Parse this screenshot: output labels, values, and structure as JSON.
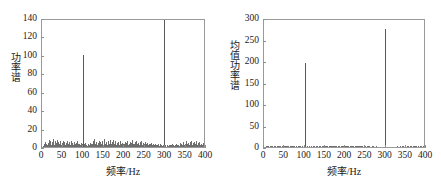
{
  "figure": {
    "panels": [
      "left",
      "right"
    ]
  },
  "chart_data": [
    {
      "panel": "left",
      "type": "line",
      "title": "",
      "xlabel": "频率/Hz",
      "ylabel": "功率谱",
      "xlim": [
        0,
        400
      ],
      "ylim": [
        0,
        140
      ],
      "xticks": [
        0,
        50,
        100,
        150,
        200,
        250,
        300,
        350,
        400
      ],
      "xtick_labels": [
        "0",
        "50",
        "100",
        "150",
        "200",
        "250",
        "300",
        "350",
        "400"
      ],
      "yticks": [
        0,
        20,
        40,
        60,
        80,
        100,
        120,
        140
      ],
      "ytick_labels": [
        "0",
        "20",
        "40",
        "60",
        "80",
        "100",
        "120",
        "140"
      ],
      "grid": false,
      "legend": null,
      "peaks": [
        {
          "x": 100,
          "y": 100
        },
        {
          "x": 301,
          "y": 140
        }
      ],
      "x": [
        2,
        4,
        6,
        8,
        10,
        12,
        14,
        16,
        18,
        20,
        22,
        24,
        26,
        28,
        30,
        32,
        34,
        36,
        38,
        40,
        42,
        44,
        46,
        48,
        50,
        52,
        54,
        56,
        58,
        60,
        62,
        64,
        66,
        68,
        70,
        72,
        74,
        76,
        78,
        80,
        82,
        84,
        86,
        88,
        90,
        92,
        94,
        96,
        98,
        100,
        102,
        104,
        106,
        108,
        110,
        112,
        114,
        116,
        118,
        120,
        122,
        124,
        126,
        128,
        130,
        132,
        134,
        136,
        138,
        140,
        142,
        144,
        146,
        148,
        150,
        152,
        154,
        156,
        158,
        160,
        162,
        164,
        166,
        168,
        170,
        172,
        174,
        176,
        178,
        180,
        182,
        184,
        186,
        188,
        190,
        192,
        194,
        196,
        198,
        200,
        202,
        204,
        206,
        208,
        210,
        212,
        214,
        216,
        218,
        220,
        222,
        224,
        226,
        228,
        230,
        232,
        234,
        236,
        238,
        240,
        242,
        244,
        246,
        248,
        250,
        252,
        254,
        256,
        258,
        260,
        262,
        264,
        266,
        268,
        270,
        272,
        274,
        276,
        278,
        280,
        282,
        284,
        286,
        288,
        290,
        292,
        294,
        296,
        298,
        301,
        304,
        306,
        308,
        310,
        312,
        314,
        316,
        318,
        320,
        322,
        324,
        326,
        328,
        330,
        332,
        334,
        336,
        338,
        340,
        342,
        344,
        346,
        348,
        350,
        352,
        354,
        356,
        358,
        360,
        362,
        364,
        366,
        368,
        370,
        372,
        374,
        376,
        378,
        380,
        382,
        384,
        386,
        388,
        390,
        392,
        394,
        396,
        398
      ],
      "values": [
        1.5,
        3.0,
        2.2,
        5.5,
        3.2,
        1.8,
        4.8,
        7.2,
        3.4,
        6.8,
        2.6,
        5.0,
        8.4,
        3.6,
        2.0,
        6.2,
        4.4,
        7.6,
        2.8,
        5.4,
        3.0,
        6.0,
        2.4,
        4.2,
        7.0,
        3.2,
        5.8,
        2.2,
        4.6,
        6.4,
        2.8,
        3.8,
        5.2,
        2.0,
        6.6,
        3.4,
        4.0,
        2.6,
        5.6,
        3.0,
        2.2,
        4.4,
        6.0,
        2.8,
        3.6,
        1.8,
        4.8,
        2.4,
        3.2,
        100.0,
        3.0,
        2.0,
        4.2,
        2.6,
        1.6,
        3.4,
        2.2,
        4.0,
        1.8,
        2.8,
        3.6,
        6.4,
        2.4,
        8.2,
        3.0,
        5.6,
        2.0,
        4.4,
        7.0,
        2.6,
        5.2,
        3.4,
        6.8,
        2.2,
        4.0,
        8.6,
        3.2,
        5.8,
        2.4,
        6.2,
        4.6,
        2.8,
        7.4,
        3.0,
        5.0,
        2.2,
        8.0,
        3.8,
        6.6,
        2.6,
        4.2,
        3.0,
        5.4,
        2.0,
        6.0,
        3.6,
        2.4,
        4.8,
        2.8,
        3.2,
        5.6,
        2.2,
        4.0,
        6.2,
        2.6,
        3.4,
        5.0,
        2.0,
        4.6,
        7.2,
        2.8,
        3.8,
        5.8,
        2.4,
        6.4,
        3.0,
        4.2,
        2.2,
        5.2,
        3.6,
        6.8,
        2.6,
        4.4,
        3.2,
        5.6,
        2.0,
        3.0,
        4.8,
        2.4,
        3.4,
        1.8,
        2.8,
        4.0,
        2.2,
        3.2,
        1.6,
        2.6,
        3.8,
        2.0,
        1.8,
        3.0,
        2.4,
        1.4,
        2.8,
        2.0,
        1.6,
        2.2,
        1.8,
        140.0,
        2.2,
        1.6,
        2.0,
        1.4,
        2.6,
        1.8,
        2.2,
        1.6,
        2.8,
        2.0,
        1.4,
        2.4,
        1.8,
        3.2,
        2.0,
        2.6,
        1.6,
        4.2,
        2.2,
        3.0,
        1.8,
        5.4,
        2.6,
        3.8,
        2.0,
        6.0,
        3.2,
        4.6,
        2.4,
        5.0,
        3.0,
        6.6,
        2.2,
        4.0,
        5.8,
        2.8,
        3.6,
        6.2,
        2.4,
        4.4,
        3.0,
        5.2,
        2.0,
        3.8,
        2.6,
        4.8,
        2.2,
        3.4,
        5.0,
        2.8,
        3.0,
        2.0
      ]
    },
    {
      "panel": "right",
      "type": "line",
      "title": "",
      "xlabel": "频率/Hz",
      "ylabel": "均值功率谱",
      "xlim": [
        0,
        400
      ],
      "ylim": [
        0,
        300
      ],
      "xticks": [
        0,
        50,
        100,
        150,
        200,
        250,
        300,
        350,
        400
      ],
      "xtick_labels": [
        "0",
        "50",
        "100",
        "150",
        "200",
        "250",
        "300",
        "350",
        "400"
      ],
      "yticks": [
        0,
        50,
        100,
        150,
        200,
        250,
        300
      ],
      "ytick_labels": [
        "0",
        "50",
        "100",
        "150",
        "200",
        "250",
        "300"
      ],
      "grid": false,
      "legend": null,
      "peaks": [
        {
          "x": 100,
          "y": 195
        },
        {
          "x": 301,
          "y": 275
        }
      ],
      "x": [
        2,
        4,
        6,
        8,
        10,
        12,
        14,
        16,
        18,
        20,
        22,
        24,
        26,
        28,
        30,
        32,
        34,
        36,
        38,
        40,
        42,
        44,
        46,
        48,
        50,
        52,
        54,
        56,
        58,
        60,
        62,
        64,
        66,
        68,
        70,
        72,
        74,
        76,
        78,
        80,
        82,
        84,
        86,
        88,
        90,
        92,
        94,
        96,
        98,
        100,
        102,
        104,
        106,
        108,
        110,
        112,
        114,
        116,
        118,
        120,
        122,
        124,
        126,
        128,
        130,
        132,
        134,
        136,
        138,
        140,
        142,
        144,
        146,
        148,
        150,
        152,
        154,
        156,
        158,
        160,
        162,
        164,
        166,
        168,
        170,
        172,
        174,
        176,
        178,
        180,
        182,
        184,
        186,
        188,
        190,
        192,
        194,
        196,
        198,
        200,
        202,
        204,
        206,
        208,
        210,
        212,
        214,
        216,
        218,
        220,
        222,
        224,
        226,
        228,
        230,
        232,
        234,
        236,
        238,
        240,
        242,
        244,
        246,
        248,
        250,
        252,
        254,
        256,
        258,
        260,
        262,
        264,
        266,
        268,
        270,
        272,
        274,
        276,
        278,
        280,
        282,
        284,
        286,
        288,
        290,
        292,
        294,
        296,
        298,
        301,
        304,
        306,
        308,
        310,
        312,
        314,
        316,
        318,
        320,
        322,
        324,
        326,
        328,
        330,
        332,
        334,
        336,
        338,
        340,
        342,
        344,
        346,
        348,
        350,
        352,
        354,
        356,
        358,
        360,
        362,
        364,
        366,
        368,
        370,
        372,
        374,
        376,
        378,
        380,
        382,
        384,
        386,
        388,
        390,
        392,
        394,
        396,
        398
      ],
      "values": [
        1.0,
        1.6,
        1.2,
        2.0,
        1.4,
        1.0,
        1.8,
        2.4,
        1.2,
        2.0,
        1.0,
        1.6,
        2.6,
        1.4,
        1.0,
        1.8,
        1.4,
        2.2,
        1.2,
        1.8,
        1.0,
        1.6,
        1.0,
        1.4,
        2.0,
        1.2,
        1.8,
        1.0,
        1.4,
        1.8,
        1.0,
        1.2,
        1.6,
        1.0,
        2.0,
        1.2,
        1.4,
        1.0,
        1.8,
        1.2,
        1.0,
        1.4,
        1.8,
        1.0,
        1.2,
        0.8,
        1.6,
        1.0,
        1.2,
        195.0,
        1.2,
        1.0,
        1.4,
        1.0,
        0.8,
        1.2,
        1.0,
        1.4,
        0.8,
        1.2,
        1.4,
        2.0,
        1.0,
        2.4,
        1.2,
        1.8,
        1.0,
        1.4,
        2.2,
        1.0,
        1.6,
        1.2,
        2.0,
        1.0,
        1.4,
        2.6,
        1.2,
        1.8,
        1.0,
        1.8,
        1.4,
        1.0,
        2.2,
        1.2,
        1.6,
        1.0,
        2.4,
        1.4,
        2.0,
        1.0,
        1.4,
        1.2,
        1.6,
        1.0,
        1.8,
        1.2,
        1.0,
        1.4,
        1.0,
        1.2,
        1.8,
        1.0,
        1.4,
        1.8,
        1.0,
        1.2,
        1.6,
        1.0,
        1.4,
        2.2,
        1.0,
        1.2,
        1.8,
        1.0,
        2.0,
        1.2,
        1.4,
        1.0,
        1.6,
        1.2,
        2.0,
        1.0,
        1.4,
        1.2,
        1.8,
        0.8,
        1.2,
        1.4,
        1.0,
        1.2,
        0.8,
        1.0,
        1.4,
        1.0,
        1.2,
        0.8,
        1.0,
        1.2,
        0.8,
        0.8,
        1.0,
        1.0,
        0.6,
        1.0,
        0.8,
        0.6,
        0.8,
        0.8,
        275.0,
        0.8,
        0.6,
        0.8,
        0.6,
        1.0,
        0.8,
        0.8,
        0.6,
        1.0,
        0.8,
        0.6,
        1.0,
        0.8,
        1.2,
        0.8,
        1.0,
        0.6,
        1.4,
        0.8,
        1.2,
        0.8,
        1.8,
        1.0,
        1.4,
        0.8,
        2.0,
        1.2,
        1.6,
        1.0,
        1.8,
        1.2,
        2.2,
        0.8,
        1.4,
        1.8,
        1.0,
        1.2,
        2.0,
        1.0,
        1.4,
        1.0,
        1.6,
        0.8,
        1.2,
        1.0,
        1.6,
        0.8,
        1.2,
        1.6,
        1.0,
        1.0,
        0.8
      ]
    }
  ]
}
